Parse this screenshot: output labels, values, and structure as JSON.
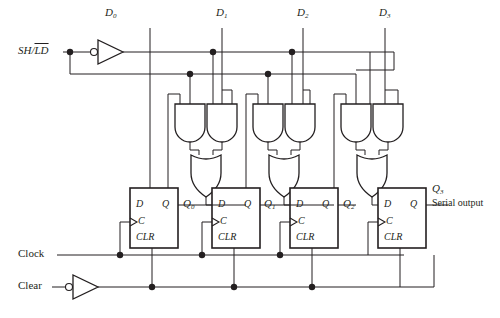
{
  "diagram": {
    "type": "logic-circuit-schematic",
    "line_color": "#231f20",
    "background": "#ffffff"
  },
  "inputs": {
    "shift_load": {
      "label_prefix": "SH/",
      "label_overline": "LD",
      "full": "SH/LD"
    },
    "clock": {
      "label": "Clock"
    },
    "clear": {
      "label": "Clear"
    },
    "parallel": [
      {
        "label": "D",
        "sub": "0"
      },
      {
        "label": "D",
        "sub": "1"
      },
      {
        "label": "D",
        "sub": "2"
      },
      {
        "label": "D",
        "sub": "3"
      }
    ]
  },
  "outputs": {
    "q": [
      {
        "label": "Q",
        "sub": "0"
      },
      {
        "label": "Q",
        "sub": "1"
      },
      {
        "label": "Q",
        "sub": "2"
      },
      {
        "label": "Q",
        "sub": "3"
      }
    ],
    "serial": {
      "label": "Serial output"
    }
  },
  "flipflops": [
    {
      "name": "ff0",
      "d": "D",
      "q": "Q",
      "c": "C",
      "clr": "CLR"
    },
    {
      "name": "ff1",
      "d": "D",
      "q": "Q",
      "c": "C",
      "clr": "CLR"
    },
    {
      "name": "ff2",
      "d": "D",
      "q": "Q",
      "c": "C",
      "clr": "CLR"
    },
    {
      "name": "ff3",
      "d": "D",
      "q": "Q",
      "c": "C",
      "clr": "CLR"
    }
  ],
  "gates": {
    "inverters": 2,
    "and_gates": 6,
    "or_gates": 3
  }
}
